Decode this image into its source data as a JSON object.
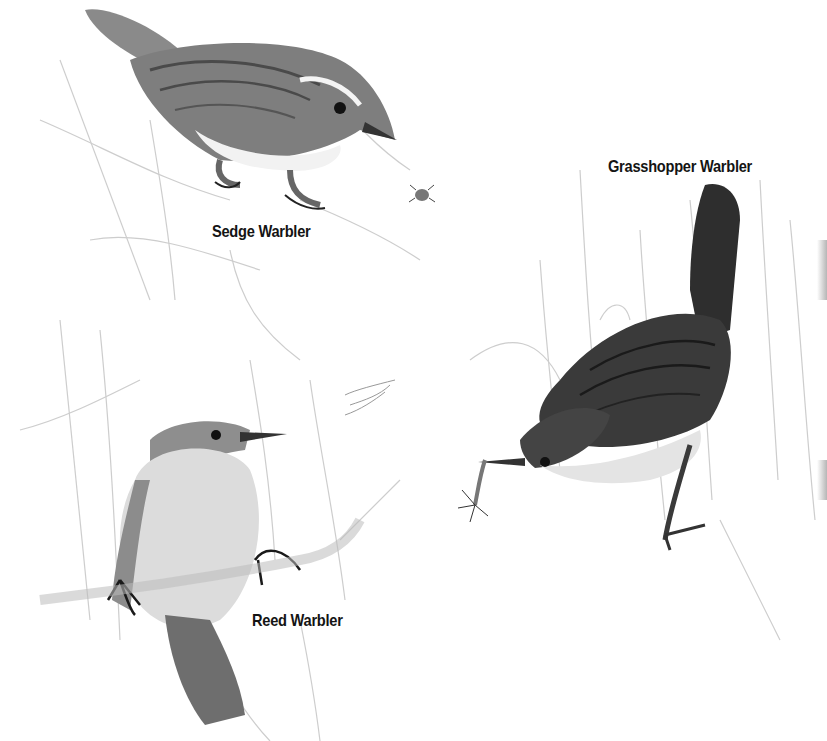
{
  "plate": {
    "background": "#ffffff",
    "style": "monochrome field-guide illustration of warblers among reeds"
  },
  "birds": [
    {
      "id": "sedge",
      "label": "Sedge Warbler",
      "label_pos": {
        "x": 212,
        "y": 222
      },
      "colors": {
        "back": "#8a8a8a",
        "streak": "#4a4a4a",
        "belly": "#f2f2f2",
        "eye": "#111111"
      }
    },
    {
      "id": "grasshopper",
      "label": "Grasshopper Warbler",
      "label_pos": {
        "x": 608,
        "y": 157
      },
      "colors": {
        "back": "#3c3c3c",
        "streak": "#1e1e1e",
        "belly": "#e6e6e6",
        "eye": "#111111"
      }
    },
    {
      "id": "reed",
      "label": "Reed Warbler",
      "label_pos": {
        "x": 252,
        "y": 611
      },
      "colors": {
        "back": "#8c8c8c",
        "belly": "#dcdcdc",
        "tail": "#6e6e6e",
        "eye": "#111111"
      }
    }
  ],
  "extras": {
    "insects": [
      "beetle-near-sedge-warbler",
      "insect-in-grasshopper-warbler-beak",
      "flying-insect-near-reed-warbler"
    ]
  }
}
